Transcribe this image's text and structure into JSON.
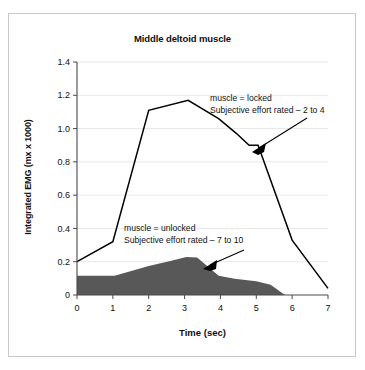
{
  "chart_data": {
    "type": "area",
    "title": "Middle deltoid muscle",
    "xlabel": "Time (sec)",
    "ylabel": "Integrated EMG (mx x 1000)",
    "xlim": [
      0,
      7
    ],
    "ylim": [
      0,
      1.4
    ],
    "grid": true,
    "legend_position": "none",
    "xticks": [
      "0",
      "1",
      "2",
      "3",
      "4",
      "5",
      "6",
      "7"
    ],
    "xtick_values": [
      0,
      1,
      2,
      3,
      4,
      5,
      6,
      7
    ],
    "yticks": [
      "0",
      "0.2",
      "0.4",
      "0.6",
      "0.8",
      "1.0",
      "1.2",
      "1.4"
    ],
    "ytick_values": [
      0,
      0.2,
      0.4,
      0.6,
      0.8,
      1.0,
      1.2,
      1.4
    ],
    "series": [
      {
        "name": "muscle = locked",
        "style": "line",
        "color": "#000000",
        "x": [
          0,
          1,
          2,
          3.1,
          3.95,
          4.45,
          4.8,
          5.05,
          6.0,
          7.0
        ],
        "values": [
          0.2,
          0.32,
          1.11,
          1.17,
          1.06,
          0.97,
          0.9,
          0.9,
          0.33,
          0.04
        ]
      },
      {
        "name": "muscle = unlocked",
        "style": "filled-area",
        "color": "#585858",
        "x": [
          0,
          1.05,
          2.0,
          2.6,
          3.05,
          3.35,
          3.95,
          4.4,
          5.0,
          5.4,
          5.8,
          7.0
        ],
        "values": [
          0.115,
          0.115,
          0.175,
          0.205,
          0.228,
          0.225,
          0.115,
          0.098,
          0.082,
          0.062,
          0.0,
          0.0
        ]
      }
    ],
    "annotations": [
      {
        "name": "locked-annotation",
        "line1": "muscle = locked",
        "line2": "Subjective effort rated – 2 to 4",
        "target_series": "muscle = locked"
      },
      {
        "name": "unlocked-annotation",
        "line1": "muscle = unlocked",
        "line2": "Subjective effort rated – 7 to 10",
        "target_series": "muscle = unlocked"
      }
    ]
  }
}
